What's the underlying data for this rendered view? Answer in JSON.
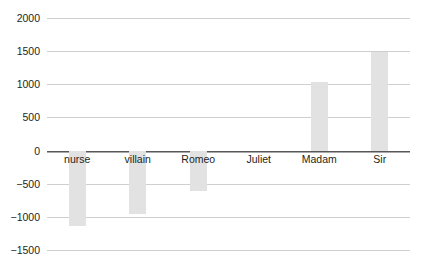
{
  "chart_data": {
    "type": "bar",
    "title": "",
    "xlabel": "",
    "ylabel": "",
    "categories": [
      "nurse",
      "villain",
      "Romeo",
      "Juliet",
      "Madam",
      "Sir"
    ],
    "values": [
      -1135,
      -960,
      -615,
      0,
      1040,
      1480
    ],
    "series": [
      {
        "name": "value",
        "values": [
          -1135,
          -960,
          -615,
          0,
          1040,
          1480
        ]
      }
    ],
    "ylim": [
      -1500,
      2000
    ],
    "ytick_values": [
      2000,
      1500,
      1000,
      500,
      0,
      -500,
      -1000,
      -1500
    ],
    "ytick_labels": [
      "2000",
      "1500",
      "1000",
      "500",
      "0",
      "−500",
      "−1000",
      "−1500"
    ],
    "grid": true,
    "grid_axis": "y",
    "legend": "none",
    "bar_color": "#e2e2e2",
    "gridline_color": "#cfcfcf",
    "zeroline_color": "#58585b",
    "background_color": "#ffffff",
    "text_color": "#231f20",
    "category_labels_position": "below-zero-line"
  }
}
